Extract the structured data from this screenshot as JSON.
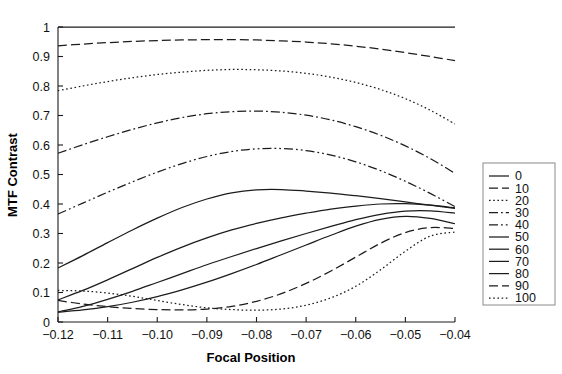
{
  "chart_data": {
    "type": "line",
    "title": "",
    "xlabel": "Focal Position",
    "ylabel": "MTF Contrast",
    "xlim": [
      -0.12,
      -0.04
    ],
    "ylim": [
      0,
      1
    ],
    "grid": false,
    "legend_position": "right-outside",
    "x_ticks": [
      "-0.12",
      "-0.11",
      "-0.10",
      "-0.09",
      "-0.08",
      "-0.07",
      "-0.06",
      "-0.05",
      "-0.04"
    ],
    "x_tick_values": [
      -0.12,
      -0.11,
      -0.1,
      -0.09,
      -0.08,
      -0.07,
      -0.06,
      -0.05,
      -0.04
    ],
    "y_ticks": [
      "0",
      "0.1",
      "0.2",
      "0.3",
      "0.4",
      "0.5",
      "0.6",
      "0.7",
      "0.8",
      "0.9",
      "1"
    ],
    "y_tick_values": [
      0,
      0.1,
      0.2,
      0.3,
      0.4,
      0.5,
      0.6,
      0.7,
      0.8,
      0.9,
      1.0
    ],
    "x": [
      -0.12,
      -0.115,
      -0.11,
      -0.105,
      -0.1,
      -0.095,
      -0.09,
      -0.085,
      -0.08,
      -0.075,
      -0.07,
      -0.065,
      -0.06,
      -0.055,
      -0.05,
      -0.045,
      -0.04
    ],
    "series": [
      {
        "name": "0",
        "dash": "solid",
        "values": [
          1.0,
          1.0,
          1.0,
          1.0,
          1.0,
          1.0,
          1.0,
          1.0,
          1.0,
          1.0,
          1.0,
          1.0,
          1.0,
          1.0,
          1.0,
          1.0,
          1.0
        ]
      },
      {
        "name": "10",
        "dash": "dashed",
        "values": [
          0.936,
          0.942,
          0.947,
          0.951,
          0.954,
          0.956,
          0.957,
          0.957,
          0.956,
          0.953,
          0.949,
          0.943,
          0.935,
          0.925,
          0.913,
          0.9,
          0.886
        ]
      },
      {
        "name": "20",
        "dash": "dotted",
        "values": [
          0.784,
          0.8,
          0.815,
          0.828,
          0.839,
          0.847,
          0.853,
          0.856,
          0.855,
          0.851,
          0.843,
          0.83,
          0.812,
          0.788,
          0.757,
          0.718,
          0.671
        ]
      },
      {
        "name": "30",
        "dash": "dashdot",
        "values": [
          0.572,
          0.601,
          0.628,
          0.653,
          0.675,
          0.693,
          0.706,
          0.713,
          0.715,
          0.711,
          0.701,
          0.685,
          0.662,
          0.633,
          0.597,
          0.554,
          0.504
        ]
      },
      {
        "name": "40",
        "dash": "dashdotdot",
        "values": [
          0.366,
          0.403,
          0.44,
          0.475,
          0.508,
          0.537,
          0.561,
          0.578,
          0.587,
          0.588,
          0.581,
          0.566,
          0.543,
          0.513,
          0.477,
          0.436,
          0.391
        ]
      },
      {
        "name": "50",
        "dash": "solid",
        "values": [
          0.183,
          0.225,
          0.269,
          0.312,
          0.352,
          0.388,
          0.417,
          0.438,
          0.448,
          0.449,
          0.444,
          0.437,
          0.428,
          0.418,
          0.407,
          0.396,
          0.385
        ]
      },
      {
        "name": "60",
        "dash": "solid",
        "values": [
          0.075,
          0.107,
          0.143,
          0.181,
          0.219,
          0.254,
          0.285,
          0.312,
          0.334,
          0.353,
          0.369,
          0.383,
          0.393,
          0.4,
          0.401,
          0.396,
          0.387
        ]
      },
      {
        "name": "70",
        "dash": "solid",
        "values": [
          0.034,
          0.053,
          0.077,
          0.104,
          0.134,
          0.164,
          0.194,
          0.222,
          0.249,
          0.275,
          0.3,
          0.324,
          0.347,
          0.365,
          0.376,
          0.377,
          0.369
        ]
      },
      {
        "name": "80",
        "dash": "solid",
        "values": [
          0.033,
          0.041,
          0.052,
          0.067,
          0.086,
          0.109,
          0.135,
          0.164,
          0.195,
          0.228,
          0.261,
          0.294,
          0.325,
          0.348,
          0.358,
          0.351,
          0.333
        ]
      },
      {
        "name": "90",
        "dash": "dashed",
        "values": [
          0.073,
          0.061,
          0.052,
          0.046,
          0.042,
          0.041,
          0.044,
          0.053,
          0.07,
          0.096,
          0.131,
          0.173,
          0.22,
          0.267,
          0.303,
          0.32,
          0.317
        ]
      },
      {
        "name": "100",
        "dash": "dotted",
        "values": [
          0.107,
          0.105,
          0.098,
          0.087,
          0.073,
          0.059,
          0.048,
          0.042,
          0.04,
          0.044,
          0.057,
          0.082,
          0.121,
          0.177,
          0.24,
          0.291,
          0.305
        ]
      }
    ]
  },
  "legend": {
    "entries": [
      {
        "label": "0"
      },
      {
        "label": "10"
      },
      {
        "label": "20"
      },
      {
        "label": "30"
      },
      {
        "label": "40"
      },
      {
        "label": "50"
      },
      {
        "label": "60"
      },
      {
        "label": "70"
      },
      {
        "label": "80"
      },
      {
        "label": "90"
      },
      {
        "label": "100"
      }
    ]
  },
  "style": {
    "curve_color": "#1c1c1c",
    "axis_color": "#1a1a1a",
    "legend_border": "#8a8a8a",
    "background": "#ffffff"
  }
}
